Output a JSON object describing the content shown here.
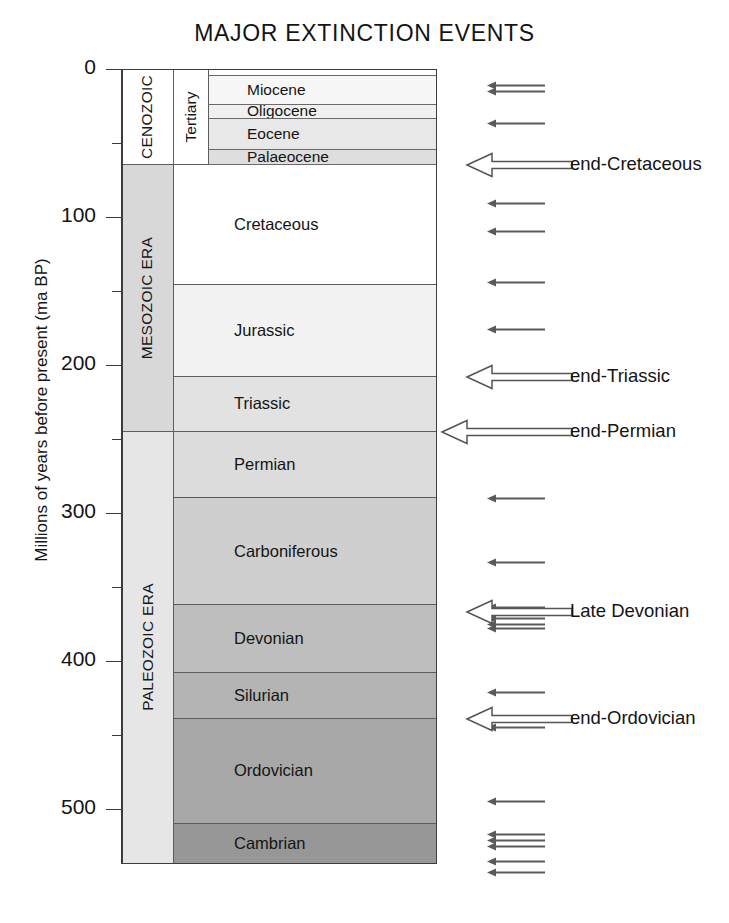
{
  "title": "MAJOR EXTINCTION EVENTS",
  "axis": {
    "label": "Millions of years before present (ma BP)",
    "major_ticks": [
      {
        "value": 0,
        "text": "0"
      },
      {
        "value": 100,
        "text": "100"
      },
      {
        "value": 200,
        "text": "200"
      },
      {
        "value": 300,
        "text": "300"
      },
      {
        "value": 400,
        "text": "400"
      },
      {
        "value": 500,
        "text": "500"
      }
    ],
    "minor_ticks": [
      50,
      150,
      250,
      350,
      450
    ],
    "range_ma": [
      0,
      537
    ]
  },
  "chart_data": {
    "type": "table",
    "title": "MAJOR EXTINCTION EVENTS",
    "ylabel": "Millions of years before present (ma BP)",
    "ylim": [
      0,
      537
    ],
    "eras": [
      {
        "name": "CENOZOIC",
        "start_ma": 0,
        "end_ma": 65,
        "shade": "#ffffff"
      },
      {
        "name": "MESOZOIC ERA",
        "start_ma": 65,
        "end_ma": 245,
        "shade": "#d8d8d8"
      },
      {
        "name": "PALEOZOIC ERA",
        "start_ma": 245,
        "end_ma": 537,
        "shade": "#e6e6e6"
      }
    ],
    "systems": [
      {
        "name": "Tertiary",
        "start_ma": 0,
        "end_ma": 65
      }
    ],
    "periods": [
      {
        "name": "Cretaceous",
        "start_ma": 65,
        "end_ma": 146,
        "shade": "#ffffff"
      },
      {
        "name": "Jurassic",
        "start_ma": 146,
        "end_ma": 208,
        "shade": "#f2f2f2"
      },
      {
        "name": "Triassic",
        "start_ma": 208,
        "end_ma": 245,
        "shade": "#e2e2e2"
      },
      {
        "name": "Permian",
        "start_ma": 245,
        "end_ma": 290,
        "shade": "#dcdcdc"
      },
      {
        "name": "Carboniferous",
        "start_ma": 290,
        "end_ma": 362,
        "shade": "#cfcfcf"
      },
      {
        "name": "Devonian",
        "start_ma": 362,
        "end_ma": 408,
        "shade": "#bebebe"
      },
      {
        "name": "Silurian",
        "start_ma": 408,
        "end_ma": 439,
        "shade": "#b4b4b4"
      },
      {
        "name": "Ordovician",
        "start_ma": 439,
        "end_ma": 510,
        "shade": "#a8a8a8"
      },
      {
        "name": "Cambrian",
        "start_ma": 510,
        "end_ma": 537,
        "shade": "#979797"
      }
    ],
    "epochs": [
      {
        "name": "",
        "start_ma": 0,
        "end_ma": 5,
        "shade": "#ffffff"
      },
      {
        "name": "Miocene",
        "start_ma": 5,
        "end_ma": 24,
        "shade": "#f7f7f7"
      },
      {
        "name": "Oligocene",
        "start_ma": 24,
        "end_ma": 34,
        "shade": "#f0f0f0"
      },
      {
        "name": "Eocene",
        "start_ma": 34,
        "end_ma": 55,
        "shade": "#e8e8e8"
      },
      {
        "name": "Palaeocene",
        "start_ma": 55,
        "end_ma": 65,
        "shade": "#dedede"
      }
    ],
    "major_extinctions": [
      {
        "label": "end-Cretaceous",
        "age_ma": 65
      },
      {
        "label": "end-Triassic",
        "age_ma": 208
      },
      {
        "label": "end-Permian",
        "age_ma": 245
      },
      {
        "label": "Late Devonian",
        "age_ma": 367
      },
      {
        "label": "end-Ordovician",
        "age_ma": 439
      }
    ],
    "minor_events_ma": [
      11,
      15,
      37,
      91,
      110,
      144,
      176,
      290,
      333,
      364,
      367,
      371,
      375,
      378,
      421,
      445,
      495,
      517,
      521,
      525,
      535,
      543
    ]
  },
  "legend_note": {
    "major": "large open arrow = mass extinction",
    "minor": "thin arrow = lesser extinction event"
  }
}
